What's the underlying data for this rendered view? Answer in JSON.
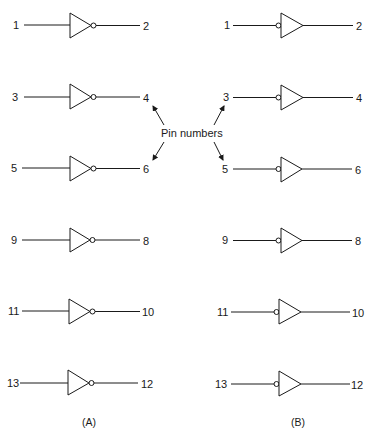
{
  "diagram": {
    "panels": [
      {
        "caption": "(A)",
        "type": "inverter",
        "gates": [
          {
            "input": "1",
            "output": "2"
          },
          {
            "input": "3",
            "output": "4"
          },
          {
            "input": "5",
            "output": "6"
          },
          {
            "input": "9",
            "output": "8"
          },
          {
            "input": "11",
            "output": "10"
          },
          {
            "input": "13",
            "output": "12"
          }
        ]
      },
      {
        "caption": "(B)",
        "type": "active-low-input buffer",
        "gates": [
          {
            "input": "1",
            "output": "2"
          },
          {
            "input": "3",
            "output": "4"
          },
          {
            "input": "5",
            "output": "6"
          },
          {
            "input": "9",
            "output": "8"
          },
          {
            "input": "11",
            "output": "10"
          },
          {
            "input": "13",
            "output": "12"
          }
        ]
      }
    ],
    "callout": {
      "text": "Pin numbers",
      "points_to": [
        "A:4",
        "A:6",
        "B:3",
        "B:5"
      ]
    },
    "colors": {
      "line": "#1a1a1a",
      "background": "#ffffff"
    }
  }
}
